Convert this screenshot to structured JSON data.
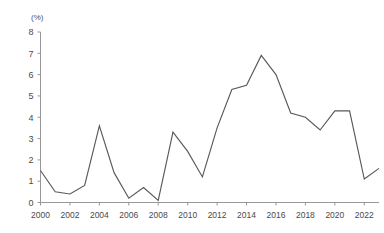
{
  "chart_data": {
    "type": "line",
    "title": "",
    "subtitle": "",
    "xlabel": "",
    "ylabel": "(%)",
    "unit_label": "(%)",
    "xlim": [
      2000,
      2023
    ],
    "ylim": [
      0,
      8
    ],
    "grid": false,
    "legend": false,
    "legend_position": "none",
    "y_ticks": [
      0,
      1,
      2,
      3,
      4,
      5,
      6,
      7,
      8
    ],
    "y_tick_labels": [
      "0",
      "1",
      "2",
      "3",
      "4",
      "5",
      "6",
      "7",
      "8"
    ],
    "x_ticks": [
      2000,
      2002,
      2004,
      2006,
      2008,
      2010,
      2012,
      2014,
      2016,
      2018,
      2020,
      2022
    ],
    "x_tick_labels": [
      "2000",
      "2002",
      "2004",
      "2006",
      "2008",
      "2010",
      "2012",
      "2014",
      "2016",
      "2018",
      "2020",
      "2022"
    ],
    "x": [
      2000,
      2001,
      2002,
      2003,
      2004,
      2005,
      2006,
      2007,
      2008,
      2009,
      2010,
      2011,
      2012,
      2013,
      2014,
      2015,
      2016,
      2017,
      2018,
      2019,
      2020,
      2021,
      2022,
      2023
    ],
    "values": [
      1.5,
      0.5,
      0.4,
      0.8,
      3.6,
      1.4,
      0.2,
      0.7,
      0.1,
      3.3,
      2.4,
      1.2,
      3.5,
      5.3,
      5.5,
      6.9,
      6.0,
      4.2,
      4.0,
      3.4,
      4.3,
      4.3,
      1.1,
      1.6
    ],
    "series": [
      {
        "name": "",
        "color": "#595959",
        "values": [
          1.5,
          0.5,
          0.4,
          0.8,
          3.6,
          1.4,
          0.2,
          0.7,
          0.1,
          3.3,
          2.4,
          1.2,
          3.5,
          5.3,
          5.5,
          6.9,
          6.0,
          4.2,
          4.0,
          3.4,
          4.3,
          4.3,
          1.1,
          1.6
        ]
      }
    ],
    "annotations": [],
    "colors": {
      "line": "#595959",
      "axis": "#8c8c8c",
      "text": "#4a4a4a",
      "background": "#ffffff"
    }
  }
}
